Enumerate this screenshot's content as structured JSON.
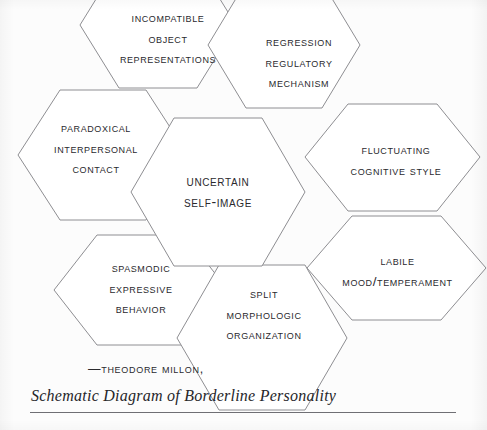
{
  "figure": {
    "background_color": "#fcfcfc",
    "line_color": "#8e8e92",
    "text_color": "#2a2a2e",
    "width": 487,
    "height": 430
  },
  "nodes": {
    "center": {
      "id": "uncertain-self-image",
      "lines": [
        "Uncertain",
        "Self-Image"
      ]
    },
    "top_left": {
      "id": "incompatible-object-representations",
      "lines": [
        "Incompatible",
        "Object",
        "Representations"
      ]
    },
    "top_right": {
      "id": "regression-regulatory-mechanism",
      "lines": [
        "Regression",
        "Regulatory",
        "Mechanism"
      ]
    },
    "left": {
      "id": "paradoxical-interpersonal-contact",
      "lines": [
        "Paradoxical",
        "Interpersonal",
        "Contact"
      ]
    },
    "right_upper": {
      "id": "fluctuating-cognitive-style",
      "lines": [
        "Fluctuating",
        "Cognitive Style"
      ]
    },
    "right_lower": {
      "id": "labile-mood-temperament",
      "lines": [
        "Labile",
        "Mood/Temperament"
      ]
    },
    "bottom_left": {
      "id": "spasmodic-expressive-behavior",
      "lines": [
        "Spasmodic",
        "Expressive",
        "Behavior"
      ]
    },
    "bottom_center": {
      "id": "split-morphologic-organization",
      "lines": [
        "Split",
        "Morphologic",
        "Organization"
      ]
    }
  },
  "caption": {
    "attribution": "—Theodore Millon,",
    "source_title": "Schematic Diagram of Borderline Personality"
  }
}
